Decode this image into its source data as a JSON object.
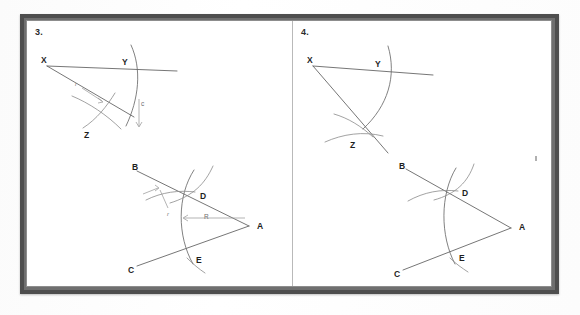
{
  "document": {
    "type": "scanned-worksheet",
    "background_color": "#ffffff",
    "frame_color": "#4e4e4e",
    "ink_color": "#5d5d5d"
  },
  "panels": [
    {
      "number": "3.",
      "name": "problem-3",
      "figures": [
        {
          "name": "angle-xyz-construction",
          "points": [
            "X",
            "Y",
            "Z"
          ],
          "annotations": [
            "r",
            "c"
          ]
        },
        {
          "name": "angle-abc-construction",
          "points": [
            "B",
            "D",
            "A",
            "E",
            "C"
          ],
          "annotations": [
            "r",
            "R"
          ]
        }
      ]
    },
    {
      "number": "4.",
      "name": "problem-4",
      "figures": [
        {
          "name": "angle-xyz-construction",
          "points": [
            "X",
            "Y",
            "Z"
          ],
          "annotations": []
        },
        {
          "name": "angle-abc-construction",
          "points": [
            "B",
            "D",
            "A",
            "E",
            "C"
          ],
          "annotations": []
        }
      ]
    }
  ],
  "labels": {
    "p3_num": "3.",
    "p3_f1_X": "X",
    "p3_f1_Y": "Y",
    "p3_f1_Z": "Z",
    "p3_f1_r": "r",
    "p3_f1_c": "c",
    "p3_f2_B": "B",
    "p3_f2_D": "D",
    "p3_f2_A": "A",
    "p3_f2_E": "E",
    "p3_f2_C": "C",
    "p3_f2_r": "r",
    "p3_f2_R": "R",
    "p4_num": "4.",
    "p4_f1_X": "X",
    "p4_f1_Y": "Y",
    "p4_f1_Z": "Z",
    "p4_f2_B": "B",
    "p4_f2_D": "D",
    "p4_f2_A": "A",
    "p4_f2_E": "E",
    "p4_f2_C": "C"
  }
}
